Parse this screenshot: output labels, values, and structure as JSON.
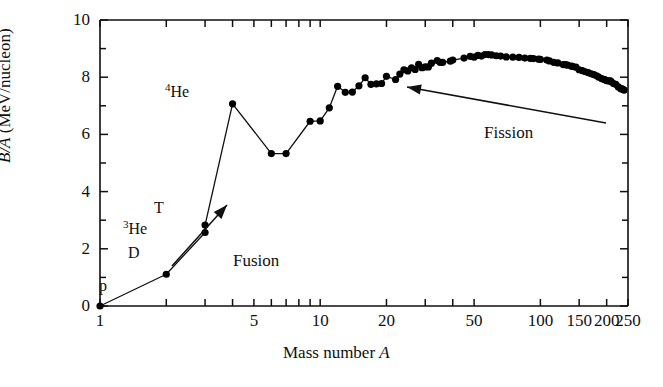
{
  "chart_data": {
    "type": "line",
    "title": "",
    "xlabel": "Mass number A",
    "ylabel": "B/A (MeV/nucleon)",
    "xscale": "log",
    "yscale": "linear",
    "xlim": [
      1,
      250
    ],
    "ylim": [
      0,
      10
    ],
    "grid": false,
    "legend": null,
    "marker": "filled-circle",
    "xticks_major": [
      1,
      5,
      10,
      20,
      50,
      100,
      150,
      200,
      250
    ],
    "xtick_labels": [
      "1",
      "5",
      "10",
      "20",
      "50",
      "100",
      "150",
      "200",
      "250"
    ],
    "xticks_minor": [
      2,
      3,
      4,
      6,
      7,
      8,
      9,
      30,
      40
    ],
    "yticks_major": [
      0,
      2,
      4,
      6,
      8,
      10
    ],
    "ytick_labels": [
      "0",
      "2",
      "4",
      "6",
      "8",
      "10"
    ],
    "yticks_minor": [
      1,
      3,
      5,
      7,
      9
    ],
    "x": [
      1,
      2,
      3,
      3,
      4,
      6,
      7,
      9,
      10,
      11,
      12,
      13,
      14,
      15,
      16,
      17,
      18,
      19,
      20,
      22,
      23,
      24,
      25,
      26,
      27,
      28,
      29,
      30,
      31,
      32,
      34,
      35,
      36,
      39,
      40,
      45,
      48,
      50,
      52,
      54,
      56,
      58,
      60,
      63,
      66,
      70,
      75,
      80,
      85,
      90,
      93,
      98,
      100,
      107,
      110,
      115,
      120,
      127,
      130,
      133,
      138,
      140,
      145,
      150,
      155,
      160,
      165,
      170,
      175,
      180,
      184,
      190,
      195,
      197,
      200,
      205,
      208,
      210,
      215,
      220,
      226,
      232,
      235,
      238,
      240
    ],
    "y": [
      0.0,
      1.11,
      2.57,
      2.83,
      7.07,
      5.33,
      5.33,
      6.46,
      6.47,
      6.93,
      7.68,
      7.47,
      7.48,
      7.7,
      7.98,
      7.75,
      7.77,
      7.78,
      8.03,
      7.92,
      8.11,
      8.26,
      8.22,
      8.33,
      8.27,
      8.45,
      8.33,
      8.36,
      8.36,
      8.49,
      8.58,
      8.52,
      8.52,
      8.56,
      8.6,
      8.67,
      8.73,
      8.7,
      8.76,
      8.74,
      8.79,
      8.79,
      8.78,
      8.75,
      8.74,
      8.71,
      8.7,
      8.69,
      8.67,
      8.66,
      8.65,
      8.63,
      8.62,
      8.6,
      8.57,
      8.52,
      8.5,
      8.44,
      8.44,
      8.42,
      8.39,
      8.38,
      8.35,
      8.26,
      8.23,
      8.19,
      8.16,
      8.12,
      8.09,
      8.05,
      8.0,
      7.95,
      7.92,
      7.91,
      7.88,
      7.87,
      7.87,
      7.84,
      7.78,
      7.75,
      7.66,
      7.6,
      7.59,
      7.57,
      7.55
    ],
    "point_labels": [
      {
        "text": "p",
        "x": 1,
        "y": 0.0
      },
      {
        "text": "D",
        "x": 2,
        "y": 1.11
      },
      {
        "text": "3He",
        "x": 3,
        "y": 2.57
      },
      {
        "text": "T",
        "x": 3,
        "y": 2.83
      },
      {
        "text": "4He",
        "x": 4,
        "y": 7.07
      }
    ],
    "annotations": [
      {
        "text": "Fusion",
        "direction": "up-right",
        "meaning": "light nuclei combine toward peak"
      },
      {
        "text": "Fission",
        "direction": "left",
        "meaning": "heavy nuclei split toward peak"
      }
    ]
  },
  "axes": {
    "ylabel_prefix": "B/A",
    "ylabel_suffix": " (MeV/nucleon)",
    "xlabel_prefix": "Mass number ",
    "xlabel_symbol": "A"
  },
  "labels": {
    "p": "p",
    "d": "D",
    "t": "T",
    "he3_sup": "3",
    "he3_base": "He",
    "he4_sup": "4",
    "he4_base": "He",
    "fusion": "Fusion",
    "fission": "Fission"
  },
  "ticks": {
    "x": [
      "1",
      "5",
      "10",
      "20",
      "50",
      "100",
      "150",
      "200",
      "250"
    ],
    "y": [
      "0",
      "2",
      "4",
      "6",
      "8",
      "10"
    ]
  },
  "colors": {
    "ink": "#101010",
    "background": "#ffffff",
    "marker": "#000000"
  }
}
